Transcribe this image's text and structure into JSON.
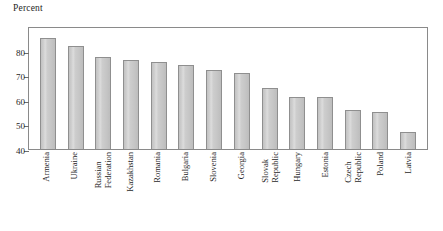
{
  "chart_data": {
    "type": "bar",
    "title": "",
    "subtitle": "",
    "xlabel": "",
    "ylabel": "Percent",
    "ylim": [
      40,
      90
    ],
    "grid": false,
    "legend": null,
    "yticks": [
      40,
      50,
      60,
      70,
      80
    ],
    "ytick_labels": [
      "40",
      "50",
      "60",
      "70",
      "80"
    ],
    "categories": [
      "Armenia",
      "Ukraine",
      "Russian Federation",
      "Kazakhstan",
      "Romania",
      "Bulgaria",
      "Slovenia",
      "Georgia",
      "Slovak Republic",
      "Hungary",
      "Estonia",
      "Czech Republic",
      "Poland",
      "Latvia"
    ],
    "category_lines": [
      [
        "Armenia"
      ],
      [
        "Ukraine"
      ],
      [
        "Russian",
        "Federation"
      ],
      [
        "Kazakhstan"
      ],
      [
        "Romania"
      ],
      [
        "Bulgaria"
      ],
      [
        "Slovenia"
      ],
      [
        "Georgia"
      ],
      [
        "Slovak",
        "Republic"
      ],
      [
        "Hungary"
      ],
      [
        "Estonia"
      ],
      [
        "Czech",
        "Republic"
      ],
      [
        "Poland"
      ],
      [
        "Latvia"
      ]
    ],
    "values": [
      85,
      82,
      77.5,
      76,
      75.5,
      74,
      72,
      71,
      65,
      61,
      61,
      56,
      55,
      47
    ],
    "bar_color": "#cccccc",
    "bar_edge_color": "#8f8f8f",
    "frame_color": "#8a8a8a",
    "text_color": "#1f1f1f"
  }
}
